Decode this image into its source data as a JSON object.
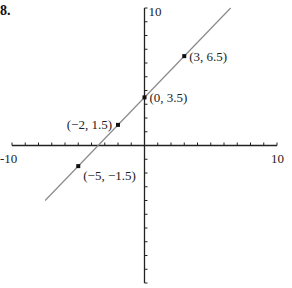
{
  "problem_number": "8.",
  "chart_data": {
    "type": "line",
    "title": "",
    "xlabel": "",
    "ylabel": "",
    "xlim": [
      -10,
      10
    ],
    "ylim": [
      -10,
      10
    ],
    "grid": false,
    "x_tick_labels": [
      "-10",
      "10"
    ],
    "y_tick_labels": [
      "10"
    ],
    "tick_step": 1,
    "line": {
      "equation": "y = x + 3.5",
      "slope": 1,
      "intercept": 3.5,
      "x_range": [
        -7.5,
        6.5
      ],
      "color": "#8a8a8a"
    },
    "points": [
      {
        "x": 3,
        "y": 6.5,
        "label": "(3, 6.5)",
        "label_side": "right"
      },
      {
        "x": 0,
        "y": 3.5,
        "label": "(0, 3.5)",
        "label_side": "right"
      },
      {
        "x": -2,
        "y": 1.5,
        "label": "(−2, 1.5)",
        "label_side": "left"
      },
      {
        "x": -5,
        "y": -1.5,
        "label": "(−5, −1.5)",
        "label_side": "right-below"
      }
    ]
  }
}
